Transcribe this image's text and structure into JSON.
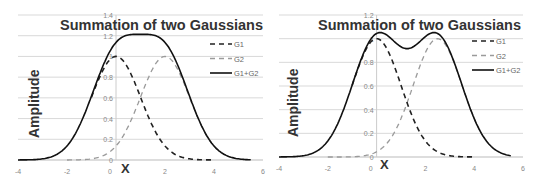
{
  "chart_data": [
    {
      "type": "line",
      "title": "Summation of two Gaussians",
      "xlabel": "X",
      "ylabel": "Amplitude",
      "xlim": [
        -4,
        6
      ],
      "ylim": [
        0,
        1.4
      ],
      "xticks": [
        "-4",
        "-2",
        "0",
        "2",
        "4",
        "6"
      ],
      "yticks": [
        "0",
        "0.2",
        "0.4",
        "0.6",
        "0.8",
        "1",
        "1.2",
        "1.4"
      ],
      "grid": "horizontal",
      "legend_position": "top-right",
      "series": [
        {
          "name": "G1",
          "style": "dashed-black",
          "center": 0,
          "sigma": 1,
          "amplitude": 1,
          "x": [
            -1,
            -0.5,
            0,
            0.5,
            1,
            1.5,
            2,
            2.5,
            3,
            3.5,
            4
          ],
          "y": [
            0.61,
            0.88,
            1.0,
            0.88,
            0.61,
            0.32,
            0.14,
            0.04,
            0.01,
            0.0,
            0.0
          ]
        },
        {
          "name": "G2",
          "style": "dashed-gray",
          "center": 2,
          "sigma": 1,
          "amplitude": 1,
          "x": [
            -2,
            -1,
            0,
            0.5,
            1,
            1.5,
            2,
            2.5,
            3
          ],
          "y": [
            0.0,
            0.01,
            0.14,
            0.32,
            0.61,
            0.88,
            1.0,
            0.88,
            0.61
          ]
        },
        {
          "name": "G1+G2",
          "style": "solid-black",
          "x": [
            -4,
            -3,
            -2,
            -1,
            0,
            0.5,
            1,
            1.5,
            2,
            3,
            4,
            5,
            5.5
          ],
          "y": [
            0.0,
            0.01,
            0.14,
            0.62,
            1.14,
            1.2,
            1.21,
            1.2,
            1.14,
            0.62,
            0.14,
            0.01,
            0.0
          ]
        }
      ]
    },
    {
      "type": "line",
      "title": "Summation of two Gaussians",
      "xlabel": "X",
      "ylabel": "Amplitude",
      "xlim": [
        -4,
        6
      ],
      "ylim": [
        0,
        1.2
      ],
      "xticks": [
        "-4",
        "-2",
        "0",
        "2",
        "4",
        "6"
      ],
      "yticks": [
        "0",
        "0.2",
        "0.4",
        "0.6",
        "0.8",
        "1",
        "1.2"
      ],
      "grid": "horizontal",
      "legend_position": "top-right",
      "series": [
        {
          "name": "G1",
          "style": "dashed-black",
          "center": 0,
          "sigma": 1,
          "amplitude": 1,
          "x": [
            -1,
            -0.5,
            0,
            0.5,
            1,
            1.25,
            1.5,
            2,
            2.5,
            3,
            4
          ],
          "y": [
            0.61,
            0.88,
            1.0,
            0.88,
            0.61,
            0.46,
            0.32,
            0.14,
            0.04,
            0.01,
            0.0
          ]
        },
        {
          "name": "G2",
          "style": "dashed-gray",
          "center": 2.5,
          "sigma": 1,
          "amplitude": 1,
          "x": [
            -1,
            0,
            0.5,
            1,
            1.25,
            1.5,
            2,
            2.5,
            3
          ],
          "y": [
            0.0,
            0.04,
            0.14,
            0.32,
            0.46,
            0.61,
            0.88,
            1.0,
            0.88
          ]
        },
        {
          "name": "G1+G2",
          "style": "solid-black",
          "x": [
            -4,
            -3,
            -2,
            -1,
            0,
            0.2,
            1.25,
            2.3,
            2.5,
            3.5,
            4.5,
            5.5
          ],
          "y": [
            0.0,
            0.01,
            0.14,
            0.61,
            1.04,
            1.05,
            0.92,
            1.05,
            1.04,
            0.61,
            0.14,
            0.01
          ]
        }
      ]
    }
  ],
  "panels": [
    {
      "title": "Summation of two Gaussians",
      "ylabel": "Amplitude",
      "xlabel": "X",
      "legend": [
        "G1",
        "G2",
        "G1+G2"
      ]
    },
    {
      "title": "Summation of two Gaussians",
      "ylabel": "Amplitude",
      "xlabel": "X",
      "legend": [
        "G1",
        "G2",
        "G1+G2"
      ]
    }
  ],
  "colors": {
    "g1": "#222222",
    "g2": "#9a9a9a",
    "sum": "#111111",
    "grid": "#d9d9d9",
    "tick": "#888888"
  }
}
